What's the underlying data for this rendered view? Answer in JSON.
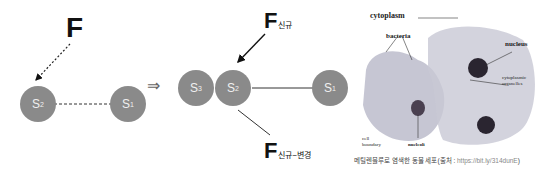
{
  "left_diagram": {
    "force_label": "F",
    "nodes": [
      {
        "id": "s2",
        "label": "S",
        "subscript": "2"
      },
      {
        "id": "s1",
        "label": "S",
        "subscript": "1"
      }
    ]
  },
  "arrow_symbol": "⇒",
  "middle_diagram": {
    "force_new": {
      "label": "F",
      "subscript": "신규"
    },
    "force_new_change": {
      "label": "F",
      "subscript": "신규−변경"
    },
    "nodes": [
      {
        "id": "s3",
        "label": "S",
        "subscript": "3"
      },
      {
        "id": "s2",
        "label": "S",
        "subscript": "2"
      },
      {
        "id": "s1",
        "label": "S",
        "subscript": "1"
      }
    ]
  },
  "micrograph": {
    "labels": {
      "cytoplasm": "cytoplasm",
      "bacteria": "bacteria",
      "nucleus": "nucleus",
      "cytoplasmic_organelles_1": "cytoplasmic",
      "cytoplasmic_organelles_2": "organelles",
      "cell_boundary_1": "cell",
      "cell_boundary_2": "boundary",
      "nucleoli": "nucleoli"
    },
    "caption": "메틸렌블루로 염색한 동물 세포(출처 : ",
    "caption_url": "https://bit.ly/314dunE",
    "caption_end": ")"
  }
}
